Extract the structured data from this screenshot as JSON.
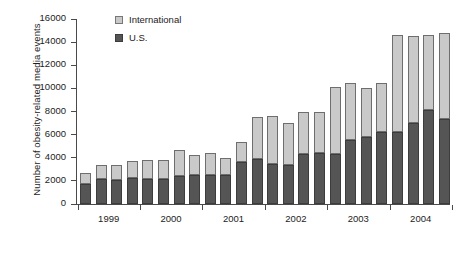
{
  "chart_data": {
    "type": "bar",
    "stacked": true,
    "title": "",
    "xlabel": "",
    "ylabel": "Number of obesity-related media events",
    "ylim": [
      0,
      16000
    ],
    "yticks": [
      0,
      2000,
      4000,
      6000,
      8000,
      10000,
      12000,
      14000,
      16000
    ],
    "ytick_labels": [
      "0",
      "2000",
      "4000",
      "6000",
      "8000",
      "10000",
      "12000",
      "14000",
      "16000"
    ],
    "grid": false,
    "legend_position": "top-left-inside",
    "categories": [
      "1999 Q1",
      "1999 Q2",
      "1999 Q3",
      "1999 Q4",
      "2000 Q1",
      "2000 Q2",
      "2000 Q3",
      "2000 Q4",
      "2001 Q1",
      "2001 Q2",
      "2001 Q3",
      "2001 Q4",
      "2002 Q1",
      "2002 Q2",
      "2002 Q3",
      "2002 Q4",
      "2003 Q1",
      "2003 Q2",
      "2003 Q3",
      "2003 Q4",
      "2004 Q1",
      "2004 Q2",
      "2004 Q3",
      "2004 Q4"
    ],
    "x_group_labels": [
      "1999",
      "2000",
      "2001",
      "2002",
      "2003",
      "2004"
    ],
    "series": [
      {
        "name": "U.S.",
        "color": "#555555",
        "values": [
          1750,
          2200,
          2100,
          2250,
          2150,
          2150,
          2400,
          2500,
          2500,
          2500,
          3600,
          3850,
          3500,
          3400,
          4300,
          4400,
          4350,
          5550,
          5800,
          6200,
          6200,
          7000,
          8150,
          7350
        ]
      },
      {
        "name": "International",
        "color": "#c9c9c9",
        "values": [
          950,
          1150,
          1250,
          1500,
          1650,
          1650,
          2300,
          1700,
          1900,
          1500,
          1800,
          3700,
          4100,
          3600,
          3700,
          3600,
          5750,
          4950,
          4200,
          4300,
          8400,
          7550,
          6450,
          7450
        ]
      }
    ],
    "totals": [
      2700,
      3350,
      3350,
      3750,
      3800,
      3800,
      4700,
      4200,
      4400,
      4000,
      5400,
      7550,
      7600,
      7000,
      8000,
      8000,
      10100,
      10500,
      10000,
      10500,
      14600,
      14550,
      14600,
      14800
    ]
  },
  "legend": {
    "items": [
      {
        "label": "International",
        "swatch": "international-swatch"
      },
      {
        "label": "U.S.",
        "swatch": "us-swatch"
      }
    ]
  }
}
